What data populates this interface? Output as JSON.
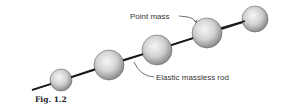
{
  "figure": {
    "caption": "Fig. 1.2",
    "labels": {
      "point_mass": "Point mass",
      "rod": "Elastic massless rod"
    },
    "colors": {
      "rod": "#1a1a1a",
      "sphere_light": "#f4f4f4",
      "sphere_dark": "#8a8a8a",
      "sphere_outline": "#555555",
      "text": "#333333"
    },
    "rod_line": {
      "x1": 32,
      "y1": 90,
      "x2": 250,
      "y2": 20
    },
    "spheres": [
      {
        "cx": 61,
        "cy": 80,
        "r": 11
      },
      {
        "cx": 109,
        "cy": 65,
        "r": 15
      },
      {
        "cx": 157,
        "cy": 50,
        "r": 15
      },
      {
        "cx": 207,
        "cy": 33,
        "r": 15
      },
      {
        "cx": 255,
        "cy": 19,
        "r": 13
      }
    ]
  }
}
